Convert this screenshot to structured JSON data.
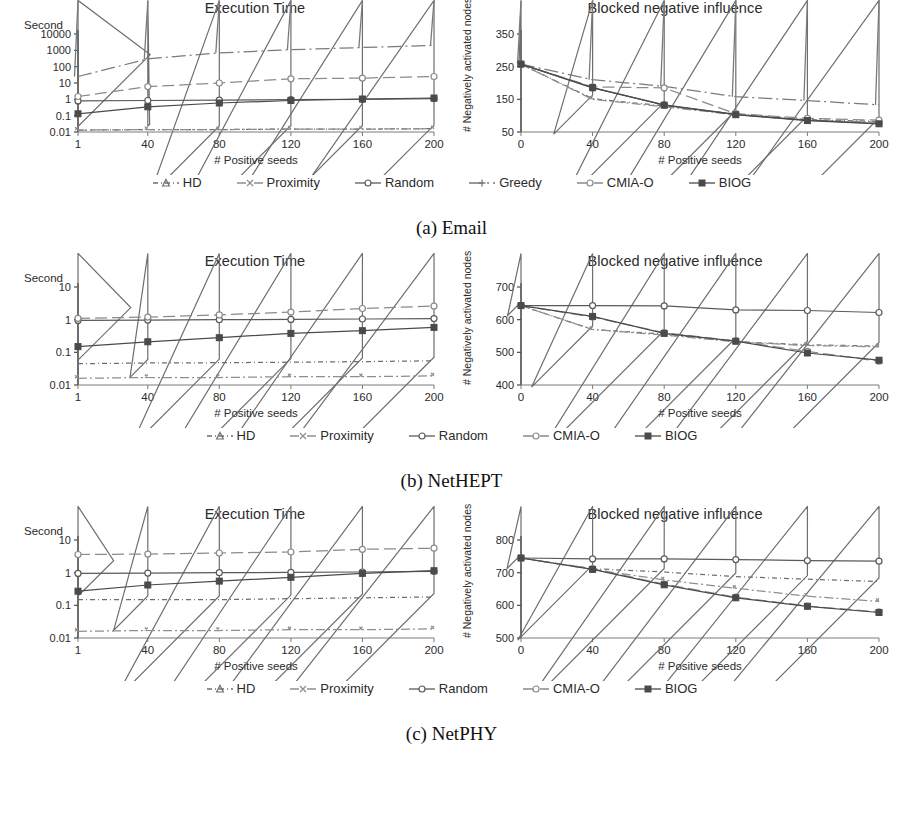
{
  "figure": {
    "panels": [
      {
        "id": "a",
        "caption": "(a) Email",
        "legend": [
          {
            "label": "HD",
            "style": "dash-dot-short",
            "marker": "triangle",
            "color": "#6e6e6e"
          },
          {
            "label": "Proximity",
            "style": "dash-dot",
            "marker": "x",
            "color": "#8e8e8e"
          },
          {
            "label": "Random",
            "style": "solid",
            "marker": "circle",
            "color": "#5a5a5a"
          },
          {
            "label": "Greedy",
            "style": "dash-dot-long",
            "marker": "plus",
            "color": "#7a7a7a"
          },
          {
            "label": "CMIA-O",
            "style": "long-dash",
            "marker": "circle",
            "color": "#8a8a8a"
          },
          {
            "label": "BIOG",
            "style": "solid",
            "marker": "square",
            "color": "#4a4a4a"
          }
        ],
        "charts": [
          {
            "side": "left",
            "chart_data": {
              "type": "line",
              "title": "Execution Time",
              "xlabel": "# Positive seeds",
              "ylabel": "Second",
              "yscale": "log",
              "ylim": [
                0.01,
                10000
              ],
              "yticks": [
                0.01,
                0.1,
                1,
                10,
                100,
                1000,
                10000
              ],
              "ytick_labels": [
                "0.01",
                "0.1",
                "1",
                "10",
                "100",
                "1000",
                "10000"
              ],
              "xlim": [
                1,
                200
              ],
              "x": [
                1,
                40,
                80,
                120,
                160,
                200
              ],
              "xtick_labels": [
                "1",
                "40",
                "80",
                "120",
                "160",
                "200"
              ],
              "grid": false,
              "legend_position": "below-figure",
              "series": [
                {
                  "name": "HD",
                  "values": [
                    0.013,
                    0.014,
                    0.014,
                    0.015,
                    0.015,
                    0.016
                  ]
                },
                {
                  "name": "Proximity",
                  "values": [
                    0.013,
                    0.014,
                    0.014,
                    0.015,
                    0.015,
                    0.016
                  ]
                },
                {
                  "name": "Random",
                  "values": [
                    0.8,
                    0.85,
                    0.9,
                    0.95,
                    1.0,
                    1.1
                  ]
                },
                {
                  "name": "Greedy",
                  "values": [
                    25,
                    300,
                    700,
                    1100,
                    1500,
                    2000
                  ]
                },
                {
                  "name": "CMIA-O",
                  "values": [
                    1.5,
                    6,
                    10,
                    18,
                    20,
                    25
                  ]
                },
                {
                  "name": "BIOG",
                  "values": [
                    0.13,
                    0.35,
                    0.6,
                    0.85,
                    1.05,
                    1.2
                  ]
                }
              ]
            }
          },
          {
            "side": "right",
            "chart_data": {
              "type": "line",
              "title": "Blocked negative influence",
              "xlabel": "# Positive seeds",
              "ylabel": "# Negatively activated nodes",
              "yscale": "linear",
              "ylim": [
                50,
                350
              ],
              "yticks": [
                50,
                150,
                250,
                350
              ],
              "ytick_labels": [
                "50",
                "150",
                "250",
                "350"
              ],
              "xlim": [
                0,
                200
              ],
              "x": [
                0,
                40,
                80,
                120,
                160,
                200
              ],
              "xtick_labels": [
                "0",
                "40",
                "80",
                "120",
                "160",
                "200"
              ],
              "grid": false,
              "legend_position": "below-figure",
              "series": [
                {
                  "name": "HD",
                  "values": [
                    258,
                    152,
                    130,
                    105,
                    88,
                    82
                  ]
                },
                {
                  "name": "Proximity",
                  "values": [
                    258,
                    150,
                    127,
                    103,
                    86,
                    80
                  ]
                },
                {
                  "name": "Random",
                  "values": [
                    258,
                    185,
                    133,
                    104,
                    86,
                    76
                  ]
                },
                {
                  "name": "Greedy",
                  "values": [
                    258,
                    210,
                    190,
                    158,
                    146,
                    133
                  ]
                },
                {
                  "name": "CMIA-O",
                  "values": [
                    258,
                    188,
                    185,
                    106,
                    92,
                    86
                  ]
                },
                {
                  "name": "BIOG",
                  "values": [
                    258,
                    186,
                    132,
                    103,
                    85,
                    75
                  ]
                }
              ]
            }
          }
        ]
      },
      {
        "id": "b",
        "caption": "(b) NetHEPT",
        "legend": [
          {
            "label": "HD",
            "style": "dash-dot-short",
            "marker": "triangle",
            "color": "#6e6e6e"
          },
          {
            "label": "Proximity",
            "style": "dash-dot",
            "marker": "x",
            "color": "#8e8e8e"
          },
          {
            "label": "Random",
            "style": "solid",
            "marker": "circle",
            "color": "#5a5a5a"
          },
          {
            "label": "CMIA-O",
            "style": "long-dash",
            "marker": "circle",
            "color": "#8a8a8a"
          },
          {
            "label": "BIOG",
            "style": "solid",
            "marker": "square",
            "color": "#4a4a4a"
          }
        ],
        "charts": [
          {
            "side": "left",
            "chart_data": {
              "type": "line",
              "title": "Execution Time",
              "xlabel": "# Positive seeds",
              "ylabel": "Second",
              "yscale": "log",
              "ylim": [
                0.01,
                10
              ],
              "yticks": [
                0.01,
                0.1,
                1,
                10
              ],
              "ytick_labels": [
                "0.01",
                "0.1",
                "1",
                "10"
              ],
              "xlim": [
                1,
                200
              ],
              "x": [
                1,
                40,
                80,
                120,
                160,
                200
              ],
              "xtick_labels": [
                "1",
                "40",
                "80",
                "120",
                "160",
                "200"
              ],
              "grid": false,
              "legend_position": "below-figure",
              "series": [
                {
                  "name": "HD",
                  "values": [
                    0.045,
                    0.047,
                    0.048,
                    0.05,
                    0.052,
                    0.055
                  ]
                },
                {
                  "name": "Proximity",
                  "values": [
                    0.016,
                    0.017,
                    0.017,
                    0.018,
                    0.018,
                    0.019
                  ]
                },
                {
                  "name": "Random",
                  "values": [
                    0.95,
                    0.97,
                    1.0,
                    1.02,
                    1.05,
                    1.08
                  ]
                },
                {
                  "name": "CMIA-O",
                  "values": [
                    1.1,
                    1.2,
                    1.4,
                    1.7,
                    2.2,
                    2.6
                  ]
                },
                {
                  "name": "BIOG",
                  "values": [
                    0.15,
                    0.21,
                    0.28,
                    0.38,
                    0.46,
                    0.58
                  ]
                }
              ]
            }
          },
          {
            "side": "right",
            "chart_data": {
              "type": "line",
              "title": "Blocked negative influence",
              "xlabel": "# Positive seeds",
              "ylabel": "# Negatively activated nodes",
              "yscale": "linear",
              "ylim": [
                400,
                700
              ],
              "yticks": [
                400,
                500,
                600,
                700
              ],
              "ytick_labels": [
                "400",
                "500",
                "600",
                "700"
              ],
              "xlim": [
                0,
                200
              ],
              "x": [
                0,
                40,
                80,
                120,
                160,
                200
              ],
              "xtick_labels": [
                "0",
                "40",
                "80",
                "120",
                "160",
                "200"
              ],
              "grid": false,
              "legend_position": "below-figure",
              "series": [
                {
                  "name": "HD",
                  "values": [
                    643,
                    570,
                    556,
                    533,
                    523,
                    519
                  ]
                },
                {
                  "name": "Proximity",
                  "values": [
                    643,
                    570,
                    553,
                    532,
                    521,
                    517
                  ]
                },
                {
                  "name": "Random",
                  "values": [
                    643,
                    643,
                    642,
                    630,
                    628,
                    622
                  ]
                },
                {
                  "name": "CMIA-O",
                  "values": [
                    643,
                    608,
                    560,
                    535,
                    503,
                    473
                  ]
                },
                {
                  "name": "BIOG",
                  "values": [
                    643,
                    610,
                    558,
                    534,
                    498,
                    476
                  ]
                }
              ]
            }
          }
        ]
      },
      {
        "id": "c",
        "caption": "(c) NetPHY",
        "legend": [
          {
            "label": "HD",
            "style": "dash-dot-short",
            "marker": "triangle",
            "color": "#6e6e6e"
          },
          {
            "label": "Proximity",
            "style": "dash-dot",
            "marker": "x",
            "color": "#8e8e8e"
          },
          {
            "label": "Random",
            "style": "solid",
            "marker": "circle",
            "color": "#5a5a5a"
          },
          {
            "label": "CMIA-O",
            "style": "long-dash",
            "marker": "circle",
            "color": "#8a8a8a"
          },
          {
            "label": "BIOG",
            "style": "solid",
            "marker": "square",
            "color": "#4a4a4a"
          }
        ],
        "charts": [
          {
            "side": "left",
            "chart_data": {
              "type": "line",
              "title": "Execution Time",
              "xlabel": "# Positive seeds",
              "ylabel": "Second",
              "yscale": "log",
              "ylim": [
                0.01,
                10
              ],
              "yticks": [
                0.01,
                0.1,
                1,
                10
              ],
              "ytick_labels": [
                "0.01",
                "0.1",
                "1",
                "10"
              ],
              "xlim": [
                1,
                200
              ],
              "x": [
                1,
                40,
                80,
                120,
                160,
                200
              ],
              "xtick_labels": [
                "1",
                "40",
                "80",
                "120",
                "160",
                "200"
              ],
              "grid": false,
              "legend_position": "below-figure",
              "series": [
                {
                  "name": "HD",
                  "values": [
                    0.15,
                    0.15,
                    0.15,
                    0.16,
                    0.17,
                    0.18
                  ]
                },
                {
                  "name": "Proximity",
                  "values": [
                    0.016,
                    0.017,
                    0.017,
                    0.018,
                    0.018,
                    0.019
                  ]
                },
                {
                  "name": "Random",
                  "values": [
                    0.95,
                    0.97,
                    1.0,
                    1.02,
                    1.05,
                    1.1
                  ]
                },
                {
                  "name": "CMIA-O",
                  "values": [
                    3.6,
                    3.7,
                    4.0,
                    4.3,
                    5.2,
                    5.6
                  ]
                },
                {
                  "name": "BIOG",
                  "values": [
                    0.27,
                    0.42,
                    0.55,
                    0.72,
                    0.95,
                    1.15
                  ]
                }
              ]
            }
          },
          {
            "side": "right",
            "chart_data": {
              "type": "line",
              "title": "Blocked negative influence",
              "xlabel": "# Positive seeds",
              "ylabel": "# Negatively activated nodes",
              "yscale": "linear",
              "ylim": [
                500,
                800
              ],
              "yticks": [
                500,
                600,
                700,
                800
              ],
              "ytick_labels": [
                "500",
                "600",
                "700",
                "800"
              ],
              "xlim": [
                0,
                200
              ],
              "x": [
                0,
                40,
                80,
                120,
                160,
                200
              ],
              "xtick_labels": [
                "0",
                "40",
                "80",
                "120",
                "160",
                "200"
              ],
              "grid": false,
              "legend_position": "below-figure",
              "series": [
                {
                  "name": "HD",
                  "values": [
                    745,
                    712,
                    702,
                    688,
                    680,
                    673
                  ]
                },
                {
                  "name": "Proximity",
                  "values": [
                    745,
                    710,
                    678,
                    652,
                    628,
                    612
                  ]
                },
                {
                  "name": "Random",
                  "values": [
                    745,
                    742,
                    742,
                    740,
                    737,
                    735
                  ]
                },
                {
                  "name": "CMIA-O",
                  "values": [
                    745,
                    712,
                    665,
                    625,
                    598,
                    580
                  ]
                },
                {
                  "name": "BIOG",
                  "values": [
                    745,
                    710,
                    663,
                    623,
                    597,
                    578
                  ]
                }
              ]
            }
          }
        ]
      }
    ]
  }
}
